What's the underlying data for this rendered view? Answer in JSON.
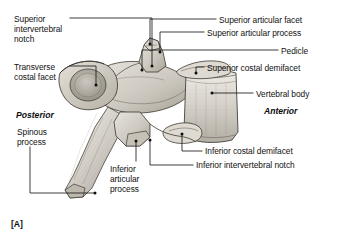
{
  "figure": {
    "caption": "[A]",
    "title_text": "Thoracic vertebra, lateral view",
    "orientation": {
      "posterior": "Posterior",
      "anterior": "Anterior"
    },
    "colors": {
      "leader_line": "#1a1a1a",
      "text": "#111111",
      "bone_light": "#e8e5e0",
      "bone_mid": "#c9c5bd",
      "bone_dark": "#9a958c",
      "background": "#ffffff"
    },
    "labels": [
      {
        "id": "superior-intervertebral-notch",
        "text": "Superior\nintervertebral\nnotch",
        "side": "left",
        "x": 14,
        "y": 14
      },
      {
        "id": "transverse-costal-facet",
        "text": "Transverse\ncostal facet",
        "side": "left",
        "x": 14,
        "y": 62
      },
      {
        "id": "spinous-process",
        "text": "Spinous\nprocess",
        "side": "left",
        "x": 17,
        "y": 127
      },
      {
        "id": "inferior-articular-process",
        "text": "Inferior\narticular\nprocess",
        "side": "left",
        "x": 110,
        "y": 164
      },
      {
        "id": "superior-articular-facet",
        "text": "Superior articular facet",
        "side": "right",
        "x": 219,
        "y": 15
      },
      {
        "id": "superior-articular-process",
        "text": "Superior articular process",
        "side": "right",
        "x": 207,
        "y": 28
      },
      {
        "id": "pedicle",
        "text": "Pedicle",
        "side": "right",
        "x": 281,
        "y": 46
      },
      {
        "id": "superior-costal-demifacet",
        "text": "Superior costal demifacet",
        "side": "right",
        "x": 207,
        "y": 63
      },
      {
        "id": "vertebral-body",
        "text": "Vertebral body",
        "side": "right",
        "x": 256,
        "y": 89
      },
      {
        "id": "inferior-costal-demifacet",
        "text": "Inferior costal demifacet",
        "side": "right",
        "x": 205,
        "y": 146
      },
      {
        "id": "inferior-intervertebral-notch",
        "text": "Inferior intervertebral notch",
        "side": "right",
        "x": 196,
        "y": 160
      }
    ]
  }
}
